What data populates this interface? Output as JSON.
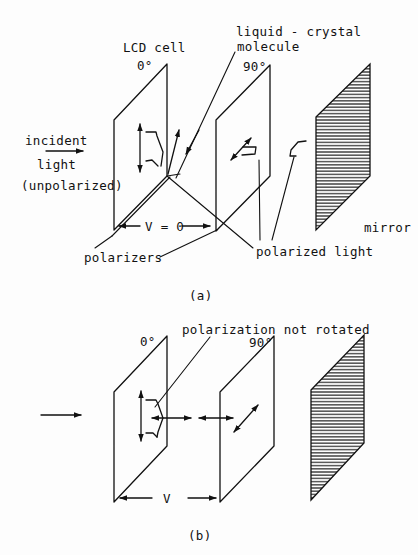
{
  "figure_a": {
    "caption": "(a)",
    "labels": {
      "lcd_cell": "LCD cell",
      "lc_molecule_line1": "liquid - crystal",
      "lc_molecule_line2": "molecule",
      "angle_left": "0°",
      "angle_right": "90°",
      "incident": "incident",
      "light": "light",
      "unpolarized": "(unpolarized)",
      "voltage": "V = 0",
      "polarizers": "polarizers",
      "polarized_light": "polarized light",
      "mirror": "mirror"
    }
  },
  "figure_b": {
    "caption": "(b)",
    "labels": {
      "note": "polarization not rotated",
      "angle_left": "0°",
      "angle_right": "90°",
      "voltage": "V"
    }
  },
  "colors": {
    "ink": "#111111",
    "paper": "#fdfdfd"
  }
}
